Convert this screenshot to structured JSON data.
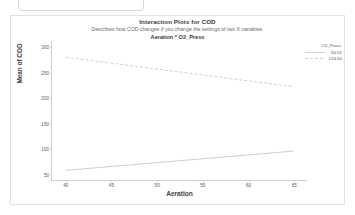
{
  "top_box": {
    "value": "",
    "placeholder": ""
  },
  "chart_data": {
    "type": "line",
    "title": "Interaction Plots for COD",
    "subtitle": "Describes how COD changes if you change the settings of two X variables.",
    "panel_title": "Aeration * O2_Press",
    "xlabel": "Aeration",
    "ylabel": "Mean of COD",
    "xlim": [
      38.5,
      66.5
    ],
    "ylim": [
      38,
      312
    ],
    "xticks": [
      "40",
      "45",
      "50",
      "55",
      "60",
      "65"
    ],
    "xtick_values": [
      40,
      45,
      50,
      55,
      60,
      65
    ],
    "yticks": [
      "50",
      "100",
      "150",
      "200",
      "250",
      "300"
    ],
    "ytick_values": [
      50,
      100,
      150,
      200,
      250,
      300
    ],
    "grid": false,
    "legend_title": "O2_Press",
    "legend_position": "top-right-outside",
    "x": [
      40,
      65
    ],
    "series": [
      {
        "name": "50.01",
        "values": [
          57,
          95
        ],
        "style": "solid",
        "color": "#c9c9c9"
      },
      {
        "name": "124.50",
        "values": [
          280,
          222
        ],
        "style": "dashed",
        "color": "#c9c9c9"
      }
    ]
  }
}
